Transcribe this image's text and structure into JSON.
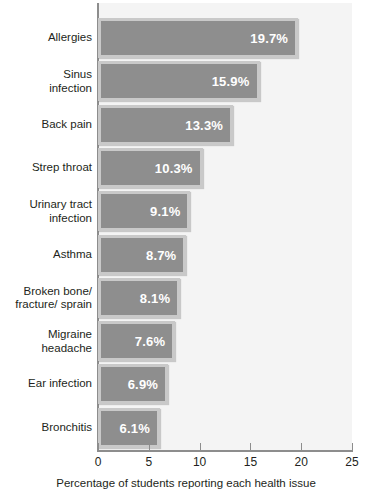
{
  "chart_data": {
    "type": "bar",
    "orientation": "horizontal",
    "title": "",
    "xlabel": "Percentage of students reporting each health issue",
    "ylabel": "",
    "xlim": [
      0,
      25
    ],
    "xticks": [
      0,
      5,
      10,
      15,
      20,
      25
    ],
    "xtick_labels": [
      "0",
      "5",
      "10",
      "15",
      "20",
      "25"
    ],
    "grid": false,
    "legend": "none",
    "categories": [
      "Allergies",
      "Sinus\ninfection",
      "Back pain",
      "Strep throat",
      "Urinary tract\ninfection",
      "Asthma",
      "Broken bone/\nfracture/ sprain",
      "Migraine\nheadache",
      "Ear infection",
      "Bronchitis"
    ],
    "values": [
      19.7,
      15.9,
      13.3,
      10.3,
      9.1,
      8.7,
      8.1,
      7.6,
      6.9,
      6.1
    ],
    "value_labels": [
      "19.7%",
      "15.9%",
      "13.3%",
      "10.3%",
      "9.1%",
      "8.7%",
      "8.1%",
      "7.6%",
      "6.9%",
      "6.1%"
    ],
    "colors": {
      "bar_fill": "#8e8e8e",
      "bar_border": "#c9c9c9",
      "plot_background": "#f4f4f4",
      "axis": "#8d8d8d",
      "text": "#231f20",
      "value_label": "#ffffff"
    }
  }
}
